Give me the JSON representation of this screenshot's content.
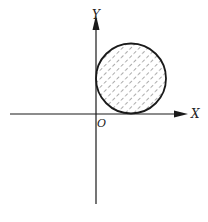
{
  "figure": {
    "type": "coordinate-diagram",
    "axes": {
      "x_label": "X",
      "y_label": "Y",
      "origin_label": "O"
    },
    "circle": {
      "quadrant": "first",
      "tangent_to": [
        "X axis",
        "Y axis"
      ],
      "fill": "diagonal-dashed-hatch"
    },
    "colors": {
      "line": "#1a1a1a",
      "hatch": "#555555",
      "background": "#ffffff"
    }
  }
}
